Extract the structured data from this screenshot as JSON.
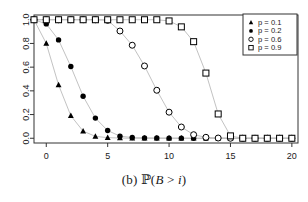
{
  "caption": {
    "index": "(b)",
    "prob_symbol": "ℙ",
    "open_paren": "(",
    "var_b": "B",
    "relation": " > ",
    "var_i": "i",
    "close_paren": ")",
    "full": "(b) ℙ(B > i)"
  },
  "legend": {
    "position": "top-right",
    "border_color": "#333333",
    "entries": [
      {
        "label": "p = 0.1",
        "marker": "filled-triangle-icon",
        "color": "#000000"
      },
      {
        "label": "p = 0.2",
        "marker": "filled-circle-icon",
        "color": "#000000"
      },
      {
        "label": "p = 0.6",
        "marker": "open-circle-icon",
        "color": "#000000"
      },
      {
        "label": "p = 0.9",
        "marker": "open-square-icon",
        "color": "#000000"
      }
    ]
  },
  "axes": {
    "x_ticks": [
      "0",
      "5",
      "10",
      "15",
      "20"
    ],
    "x_tick_values": [
      0,
      5,
      10,
      15,
      20
    ],
    "y_ticks": [
      "0.0",
      "0.2",
      "0.4",
      "0.6",
      "0.8",
      "1.0"
    ],
    "y_tick_values": [
      0.0,
      0.2,
      0.4,
      0.6,
      0.8,
      1.0
    ]
  },
  "chart_data": {
    "type": "line",
    "title": "",
    "xlabel": "",
    "ylabel": "",
    "xlim": [
      -1,
      20.5
    ],
    "ylim": [
      -0.04,
      1.04
    ],
    "grid": false,
    "legend_position": "top-right",
    "x": [
      -1,
      0,
      1,
      2,
      3,
      4,
      5,
      6,
      7,
      8,
      9,
      10,
      11,
      12,
      13,
      14,
      15,
      16,
      17,
      18,
      19,
      20
    ],
    "series": [
      {
        "name": "p = 0.1",
        "marker": "filled-triangle",
        "color": "#000000",
        "values": [
          1.0,
          0.8,
          0.45,
          0.19,
          0.06,
          0.016,
          0.005,
          0.002,
          0.0,
          0.0,
          0.0,
          0.0,
          0.0,
          0.0,
          0.0,
          0.0,
          0.0,
          0.0,
          0.0,
          0.0,
          0.0,
          0.0
        ]
      },
      {
        "name": "p = 0.2",
        "marker": "filled-circle",
        "color": "#000000",
        "values": [
          1.0,
          0.965,
          0.83,
          0.605,
          0.355,
          0.17,
          0.065,
          0.018,
          0.006,
          0.003,
          0.002,
          0.001,
          0.001,
          0.0,
          0.0,
          0.0,
          0.0,
          0.0,
          0.0,
          0.0,
          0.0,
          0.0
        ]
      },
      {
        "name": "p = 0.6",
        "marker": "open-circle",
        "color": "#000000",
        "values": [
          1.0,
          1.0,
          1.0,
          1.0,
          1.0,
          1.0,
          0.995,
          0.905,
          0.785,
          0.61,
          0.405,
          0.22,
          0.095,
          0.03,
          0.008,
          0.002,
          0.0,
          0.0,
          0.0,
          0.0,
          0.0,
          0.0
        ]
      },
      {
        "name": "p = 0.9",
        "marker": "open-square",
        "color": "#000000",
        "values": [
          1.0,
          1.0,
          1.0,
          1.0,
          1.0,
          1.0,
          1.0,
          1.0,
          1.0,
          1.0,
          1.0,
          0.99,
          0.94,
          0.815,
          0.55,
          0.205,
          0.02,
          0.0,
          0.0,
          0.0,
          0.0,
          0.0
        ]
      }
    ]
  },
  "style": {
    "line_color": "#bbbbbb",
    "frame_color": "#333333",
    "marker_color": "#000000"
  }
}
